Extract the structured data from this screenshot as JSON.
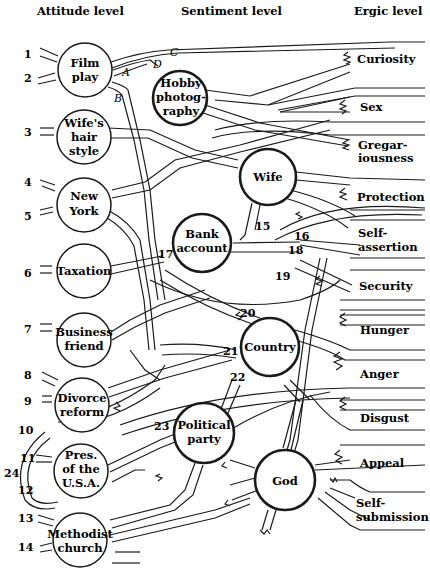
{
  "headers": {
    "attitude": "Attitude level",
    "sentiment": "Sentiment level",
    "ergic": "Ergic level"
  },
  "attitudes": [
    {
      "id": "film",
      "lines": [
        "Film",
        "play"
      ],
      "nums": [
        "1",
        "2"
      ]
    },
    {
      "id": "wife-hair",
      "lines": [
        "Wife's",
        "hair",
        "style"
      ],
      "nums": [
        "3"
      ]
    },
    {
      "id": "new-york",
      "lines": [
        "New",
        "York"
      ],
      "nums": [
        "4",
        "5"
      ]
    },
    {
      "id": "taxation",
      "lines": [
        "Taxation"
      ],
      "nums": [
        "6"
      ]
    },
    {
      "id": "business",
      "lines": [
        "Business",
        "friend"
      ],
      "nums": [
        "7"
      ]
    },
    {
      "id": "divorce",
      "lines": [
        "Divorce",
        "reform"
      ],
      "nums": [
        "8",
        "9"
      ]
    },
    {
      "id": "pres",
      "lines": [
        "Pres.",
        "of the",
        "U.S.A."
      ],
      "nums": [
        "10",
        "11",
        "12"
      ]
    },
    {
      "id": "methodist",
      "lines": [
        "Methodist",
        "church"
      ],
      "nums": [
        "13",
        "14"
      ]
    }
  ],
  "sentiments": [
    {
      "id": "hobby",
      "lines": [
        "Hobby",
        "photog-",
        "raphy"
      ]
    },
    {
      "id": "wife",
      "lines": [
        "Wife"
      ]
    },
    {
      "id": "bank",
      "lines": [
        "Bank",
        "account"
      ]
    },
    {
      "id": "country",
      "lines": [
        "Country"
      ]
    },
    {
      "id": "political",
      "lines": [
        "Political",
        "party"
      ]
    },
    {
      "id": "god",
      "lines": [
        "God"
      ]
    }
  ],
  "ergs": [
    {
      "id": "curiosity",
      "lines": [
        "Curiosity"
      ]
    },
    {
      "id": "sex",
      "lines": [
        "Sex"
      ]
    },
    {
      "id": "gregariousness",
      "lines": [
        "Gregar-",
        "iousness"
      ]
    },
    {
      "id": "protection",
      "lines": [
        "Protection"
      ]
    },
    {
      "id": "self-assertion",
      "lines": [
        "Self-",
        "assertion"
      ]
    },
    {
      "id": "security",
      "lines": [
        "Security"
      ]
    },
    {
      "id": "hunger",
      "lines": [
        "Hunger"
      ]
    },
    {
      "id": "anger",
      "lines": [
        "Anger"
      ]
    },
    {
      "id": "disgust",
      "lines": [
        "Disgust"
      ]
    },
    {
      "id": "appeal",
      "lines": [
        "Appeal"
      ]
    },
    {
      "id": "self-submission",
      "lines": [
        "Self-",
        "submission"
      ]
    }
  ],
  "path_labels": {
    "A": "A",
    "B": "B",
    "C": "C",
    "D": "D"
  },
  "link_numbers": {
    "n15": "15",
    "n16": "16",
    "n17": "17",
    "n18": "18",
    "n19": "19",
    "n20": "20",
    "n21": "21",
    "n22": "22",
    "n23": "23",
    "n24": "24"
  }
}
